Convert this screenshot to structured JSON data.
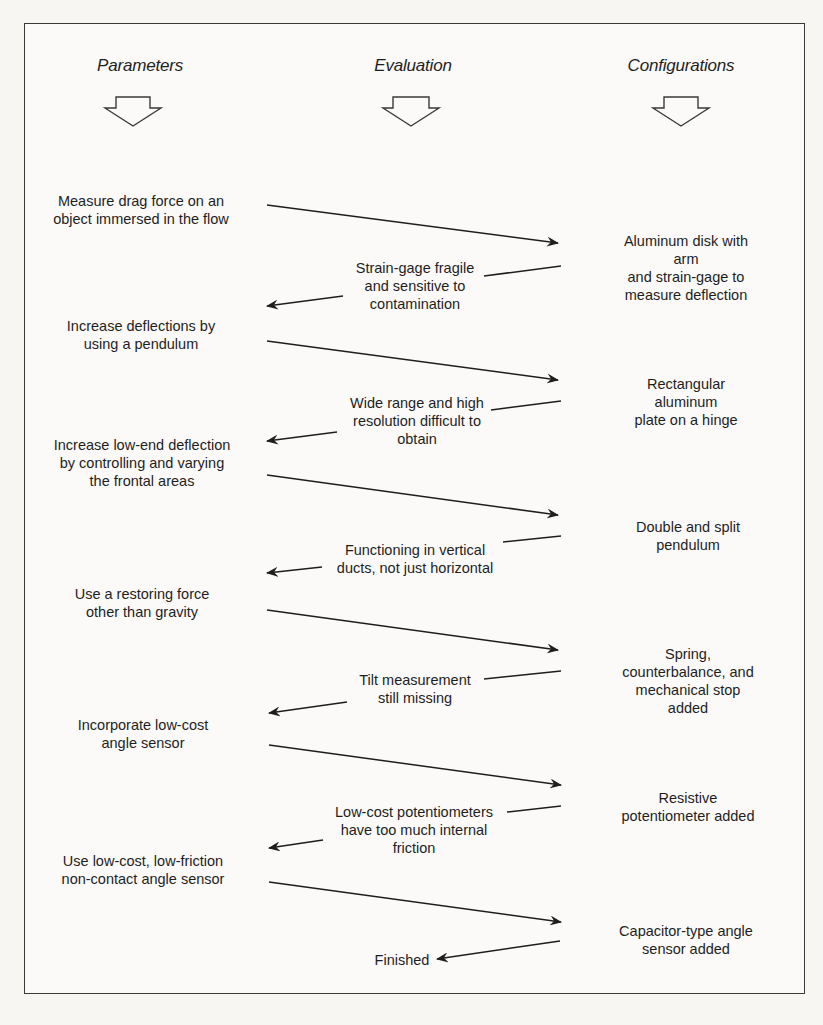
{
  "columns": {
    "parameters": "Parameters",
    "evaluation": "Evaluation",
    "configurations": "Configurations"
  },
  "parameters": [
    "Measure drag force on an\nobject immersed in the flow",
    "Increase deflections by\nusing a pendulum",
    "Increase low-end deflection\nby controlling and varying\nthe frontal areas",
    "Use a restoring force\nother than gravity",
    "Incorporate low-cost\nangle sensor",
    "Use low-cost, low-friction\nnon-contact angle sensor",
    "Finished"
  ],
  "evaluations": [
    "Strain-gage fragile\nand sensitive to\ncontamination",
    "Wide range and high\nresolution difficult to\nobtain",
    "Functioning in vertical\nducts, not just horizontal",
    "Tilt measurement\nstill missing",
    "Low-cost potentiometers\nhave too much internal\nfriction"
  ],
  "configurations": [
    "Aluminum disk with arm\nand strain-gage to\nmeasure deflection",
    "Rectangular aluminum\nplate on a hinge",
    "Double and split pendulum",
    "Spring, counterbalance, and\nmechanical stop added",
    "Resistive potentiometer added",
    "Capacitor-type angle\nsensor added"
  ],
  "colors": {
    "line": "#1e1e1e",
    "frame": "#3a3a3a",
    "background": "#f7f6f3"
  }
}
